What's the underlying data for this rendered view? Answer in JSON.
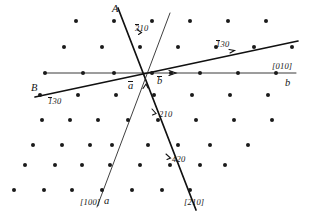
{
  "figure": {
    "type": "crystallographic-zone-diagram",
    "width": 310,
    "height": 217,
    "background_color": "#ffffff",
    "point_color": "#1a1a1a",
    "line_color": "#111111"
  },
  "labels": {
    "line_a_letter": "A",
    "line_b_letter": "B",
    "index_310": {
      "bar": "3",
      "rest": "10"
    },
    "index_130_right": {
      "bar": "1",
      "rest": "30"
    },
    "index_130_left": {
      "bar": "1",
      "rest": "30"
    },
    "index_210": "210",
    "index_420": "420",
    "axis_a_bar": "a",
    "axis_b_bar": "b",
    "direction_010": "[010]",
    "axis_b_letter": "b",
    "direction_100": "[100]",
    "axis_a_letter": "a",
    "direction_210": "[210]"
  },
  "chart_data": {
    "type": "scatter",
    "title": "",
    "xlabel": "[010] / b",
    "ylabel": "[100] / a",
    "grid": false,
    "legend": null,
    "origin_px": {
      "x": 152,
      "y": 73
    },
    "lattice": {
      "type": "oblique-centered",
      "a_spacing_px": 38,
      "row_spacing_px": 26,
      "row_stagger_px": 19,
      "row_shear_px": -7,
      "point_radius_px": 2.0
    },
    "points": [
      {
        "x": 76,
        "y": 21
      },
      {
        "x": 114,
        "y": 21
      },
      {
        "x": 152,
        "y": 21
      },
      {
        "x": 190,
        "y": 21
      },
      {
        "x": 228,
        "y": 21
      },
      {
        "x": 266,
        "y": 21
      },
      {
        "x": 64,
        "y": 47
      },
      {
        "x": 102,
        "y": 47
      },
      {
        "x": 140,
        "y": 47
      },
      {
        "x": 178,
        "y": 47
      },
      {
        "x": 216,
        "y": 47
      },
      {
        "x": 254,
        "y": 47
      },
      {
        "x": 292,
        "y": 47
      },
      {
        "x": 45,
        "y": 73
      },
      {
        "x": 83,
        "y": 73
      },
      {
        "x": 114,
        "y": 73
      },
      {
        "x": 152,
        "y": 73
      },
      {
        "x": 171,
        "y": 73
      },
      {
        "x": 200,
        "y": 73
      },
      {
        "x": 238,
        "y": 73
      },
      {
        "x": 276,
        "y": 73
      },
      {
        "x": 40,
        "y": 95
      },
      {
        "x": 78,
        "y": 95
      },
      {
        "x": 116,
        "y": 95
      },
      {
        "x": 154,
        "y": 95
      },
      {
        "x": 192,
        "y": 95
      },
      {
        "x": 230,
        "y": 95
      },
      {
        "x": 268,
        "y": 95
      },
      {
        "x": 42,
        "y": 120
      },
      {
        "x": 70,
        "y": 120
      },
      {
        "x": 98,
        "y": 120
      },
      {
        "x": 128,
        "y": 120
      },
      {
        "x": 158,
        "y": 120
      },
      {
        "x": 196,
        "y": 120
      },
      {
        "x": 234,
        "y": 120
      },
      {
        "x": 272,
        "y": 120
      },
      {
        "x": 33,
        "y": 145
      },
      {
        "x": 62,
        "y": 145
      },
      {
        "x": 90,
        "y": 145
      },
      {
        "x": 112,
        "y": 145
      },
      {
        "x": 148,
        "y": 145
      },
      {
        "x": 178,
        "y": 145
      },
      {
        "x": 210,
        "y": 145
      },
      {
        "x": 248,
        "y": 145
      },
      {
        "x": 25,
        "y": 165
      },
      {
        "x": 55,
        "y": 165
      },
      {
        "x": 82,
        "y": 165
      },
      {
        "x": 110,
        "y": 165
      },
      {
        "x": 140,
        "y": 165
      },
      {
        "x": 170,
        "y": 165
      },
      {
        "x": 200,
        "y": 165
      },
      {
        "x": 225,
        "y": 165
      },
      {
        "x": 14,
        "y": 190
      },
      {
        "x": 44,
        "y": 190
      },
      {
        "x": 72,
        "y": 190
      },
      {
        "x": 102,
        "y": 190
      },
      {
        "x": 132,
        "y": 190
      },
      {
        "x": 162,
        "y": 190
      },
      {
        "x": 190,
        "y": 190
      }
    ],
    "zone_lines": [
      {
        "name": "line-A-310",
        "label": "A",
        "index": "3̄10",
        "weight": "thick",
        "x1": 118,
        "y1": 8,
        "x2": 195,
        "y2": 209
      },
      {
        "name": "line-thin-upper-right",
        "label": "",
        "index": "",
        "weight": "thin",
        "x1": 169,
        "y1": 14,
        "x2": 98,
        "y2": 207
      },
      {
        "name": "line-B-130",
        "label": "B",
        "index": "1̄30",
        "weight": "thick",
        "x1": 35,
        "y1": 97,
        "x2": 298,
        "y2": 41
      },
      {
        "name": "axis-010-b",
        "label": "b",
        "index": "[010]",
        "weight": "axis",
        "x1": 44,
        "y1": 73,
        "x2": 295,
        "y2": 73
      }
    ],
    "marked_reflections": [
      {
        "index": "3̄10",
        "x": 141,
        "y": 28
      },
      {
        "index": "1̄30",
        "x": 235,
        "y": 50
      },
      {
        "index": "1̄30",
        "x": 80,
        "y": 92
      },
      {
        "index": "210",
        "x": 161,
        "y": 114
      },
      {
        "index": "420",
        "x": 173,
        "y": 159
      }
    ]
  }
}
